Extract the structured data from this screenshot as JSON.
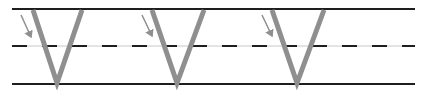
{
  "diagram": {
    "letter": "V",
    "repetitions": 3,
    "colors": {
      "background": "#ffffff",
      "rule_line": "#1e1e1e",
      "letter_stroke": "#8f8f8f",
      "arrow": "#8f8f8f",
      "guide_thin": "#c8c8c8"
    },
    "lines": {
      "top_y": 9,
      "middle_dashed_y": 46,
      "bottom_y": 84,
      "x_start": 12,
      "x_end": 415
    },
    "letters": [
      {
        "left_x": 33,
        "right_x": 82,
        "bottom_x": 57,
        "arrow": {
          "x1": 21,
          "y1": 15,
          "x2": 31,
          "y2": 37
        }
      },
      {
        "left_x": 152,
        "right_x": 204,
        "bottom_x": 177,
        "arrow": {
          "x1": 142,
          "y1": 15,
          "x2": 152,
          "y2": 36
        }
      },
      {
        "left_x": 272,
        "right_x": 324,
        "bottom_x": 297,
        "arrow": {
          "x1": 262,
          "y1": 15,
          "x2": 272,
          "y2": 36
        }
      }
    ]
  }
}
